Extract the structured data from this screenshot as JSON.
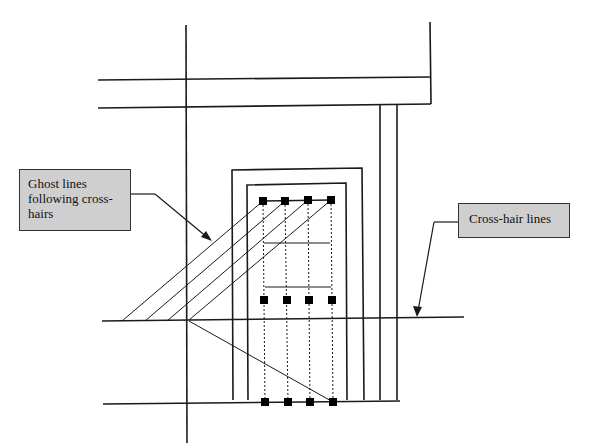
{
  "callouts": {
    "ghost_lines": "Ghost lines following cross-hairs",
    "cross_hair_lines": "Cross-hair lines"
  },
  "colors": {
    "line": "#1a1a1a",
    "callout_fill": "#cfcfcf"
  },
  "markers": {
    "top_row_count": 4,
    "middle_row_count": 4,
    "bottom_row_count": 4
  }
}
